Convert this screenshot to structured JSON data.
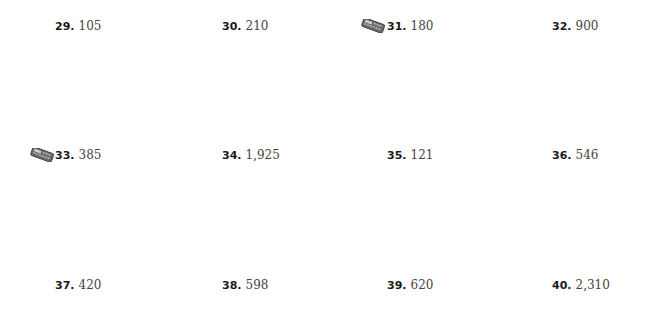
{
  "exercises": [
    {
      "number": "29.",
      "answer": "105",
      "calculator": false
    },
    {
      "number": "30.",
      "answer": "210",
      "calculator": false
    },
    {
      "number": "31.",
      "answer": "180",
      "calculator": true
    },
    {
      "number": "32.",
      "answer": "900",
      "calculator": false
    },
    {
      "number": "33.",
      "answer": "385",
      "calculator": true
    },
    {
      "number": "34.",
      "answer": "1,925",
      "calculator": false
    },
    {
      "number": "35.",
      "answer": "121",
      "calculator": false
    },
    {
      "number": "36.",
      "answer": "546",
      "calculator": false
    },
    {
      "number": "37.",
      "answer": "420",
      "calculator": false
    },
    {
      "number": "38.",
      "answer": "598",
      "calculator": false
    },
    {
      "number": "39.",
      "answer": "620",
      "calculator": false
    },
    {
      "number": "40.",
      "answer": "2,310",
      "calculator": false
    }
  ],
  "icons": {
    "calculator": "calculator-icon"
  }
}
